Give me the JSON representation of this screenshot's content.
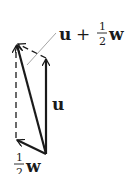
{
  "diagram": {
    "type": "vector-addition",
    "colors": {
      "stroke": "#1a1a1a",
      "leader": "#9a9a9a",
      "background": "#ffffff"
    },
    "vectors": [
      {
        "name": "u",
        "style": "solid",
        "from": [
          46,
          154
        ],
        "to": [
          46,
          58
        ]
      },
      {
        "name": "half_w",
        "style": "solid",
        "from": [
          46,
          154
        ],
        "to": [
          16,
          140
        ]
      },
      {
        "name": "u_plus_half_w",
        "style": "solid",
        "from": [
          46,
          154
        ],
        "to": [
          16,
          43
        ]
      },
      {
        "name": "half_w_shifted",
        "style": "dashed",
        "from": [
          46,
          58
        ],
        "to": [
          16,
          43
        ]
      },
      {
        "name": "u_shifted",
        "style": "dashed",
        "from": [
          16,
          140
        ],
        "to": [
          16,
          43
        ]
      }
    ],
    "labels": {
      "sum": {
        "u": "u",
        "plus": "+",
        "num": "1",
        "den": "2",
        "w": "w"
      },
      "u": "u",
      "half_w": {
        "num": "1",
        "den": "2",
        "w": "w"
      }
    }
  }
}
